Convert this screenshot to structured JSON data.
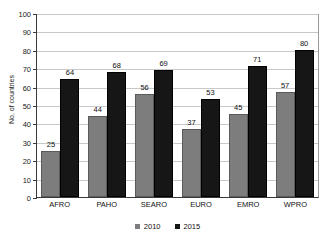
{
  "chart_data": {
    "type": "bar",
    "title": "",
    "xlabel": "",
    "ylabel": "No. of countries",
    "ylim": [
      0,
      100
    ],
    "ytick_step": 10,
    "yticks": [
      100,
      90,
      80,
      70,
      60,
      50,
      40,
      30,
      20,
      10,
      0
    ],
    "grid": true,
    "legend_position": "bottom-center",
    "categories": [
      "AFRO",
      "PAHO",
      "SEARO",
      "EURO",
      "EMRO",
      "WPRO"
    ],
    "series": [
      {
        "name": "2010",
        "color": "#7d7d7d",
        "values": [
          25,
          44,
          56,
          37,
          45,
          57
        ]
      },
      {
        "name": "2015",
        "color": "#161616",
        "values": [
          64,
          68,
          69,
          53,
          71,
          80
        ]
      }
    ]
  },
  "legend": {
    "items": [
      {
        "label": "2010"
      },
      {
        "label": "2015"
      }
    ]
  }
}
